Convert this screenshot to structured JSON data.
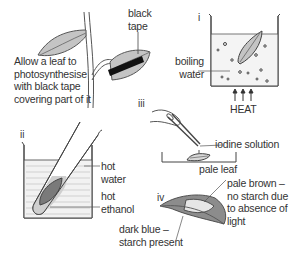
{
  "diagram": {
    "intro": {
      "text": "Allow a leaf to\nphotosynthesise\nwith black tape\ncovering part of it",
      "tape_label": "black\ntape"
    },
    "steps": [
      {
        "id": "i",
        "label": "i",
        "labels": {
          "boiling_water": "boiling\nwater",
          "heat": "HEAT"
        }
      },
      {
        "id": "ii",
        "label": "ii",
        "labels": {
          "hot_water": "hot\nwater",
          "hot_ethanol": "hot\nethanol"
        }
      },
      {
        "id": "iii",
        "label": "iii",
        "labels": {
          "iodine": "iodine solution",
          "pale_leaf": "pale leaf"
        }
      },
      {
        "id": "iv",
        "label": "iv",
        "labels": {
          "dark_blue": "dark blue –\nstarch present",
          "pale_brown": "pale brown –\nno starch due\nto absence of\nlight"
        }
      }
    ],
    "colors": {
      "line": "#444444",
      "leaf": "#bdbdbd",
      "leaf_dark": "#7a7a7a",
      "tape": "#111111",
      "water": "#f2f2f2"
    }
  }
}
